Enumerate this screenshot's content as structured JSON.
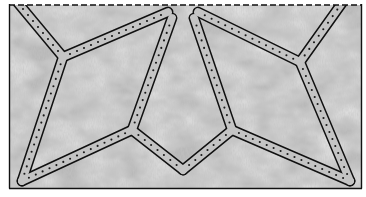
{
  "figure": {
    "colors": {
      "background": "#ffffff",
      "texture_base": "#b9b9b9",
      "texture_dark": "#9a9a9a",
      "texture_light": "#d2d2d2",
      "band_fill": "#c4c4c4",
      "line": "#111111",
      "stitch": "#1a1a1a"
    },
    "frame": {
      "x1": 9,
      "y1": 5,
      "x2": 362,
      "y2": 188,
      "top_edge": "dashed",
      "other_edges": "solid"
    },
    "bands": [
      {
        "id": "top-left-diagonal",
        "from": [
          18,
          3
        ],
        "to": [
          63,
          57
        ]
      },
      {
        "id": "left-to-top-center",
        "from": [
          63,
          57
        ],
        "to": [
          168,
          12
        ]
      },
      {
        "id": "left-vertical",
        "from": [
          63,
          57
        ],
        "to": [
          22,
          181
        ]
      },
      {
        "id": "bottom-left-to-left-vertex",
        "from": [
          22,
          181
        ],
        "to": [
          132,
          130
        ]
      },
      {
        "id": "left-vertex-to-top-notch",
        "from": [
          132,
          130
        ],
        "to": [
          172,
          18
        ]
      },
      {
        "id": "left-vertex-to-bottom-v",
        "from": [
          132,
          130
        ],
        "to": [
          183,
          170
        ]
      },
      {
        "id": "bottom-v-to-right-vertex",
        "from": [
          183,
          170
        ],
        "to": [
          232,
          130
        ]
      },
      {
        "id": "right-vertex-to-top-notch",
        "from": [
          232,
          130
        ],
        "to": [
          194,
          18
        ]
      },
      {
        "id": "right-vertex-to-bottom-right",
        "from": [
          232,
          130
        ],
        "to": [
          350,
          181
        ]
      },
      {
        "id": "bottom-right-to-right-junction",
        "from": [
          350,
          181
        ],
        "to": [
          300,
          62
        ]
      },
      {
        "id": "right-junction-to-top-center",
        "from": [
          300,
          62
        ],
        "to": [
          198,
          12
        ]
      },
      {
        "id": "right-junction-to-top-right",
        "from": [
          300,
          62
        ],
        "to": [
          342,
          3
        ]
      }
    ]
  }
}
